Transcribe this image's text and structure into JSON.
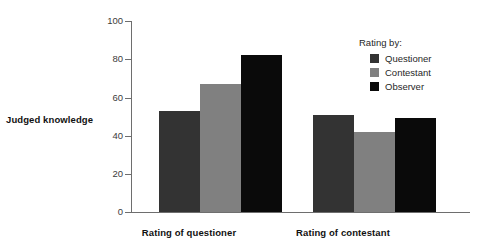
{
  "chart_data": {
    "type": "bar",
    "title": "",
    "subtitle": "",
    "xlabel": "",
    "ylabel": "Judged knowledge",
    "ylim": [
      0,
      100
    ],
    "yticks": [
      0,
      20,
      40,
      60,
      80,
      100
    ],
    "ytick_labels": [
      "0",
      "20",
      "40",
      "60",
      "80",
      "100"
    ],
    "grid": false,
    "legend_position": "top-right",
    "legend_title": "Rating by:",
    "categories": [
      "Rating of questioner",
      "Rating of contestant"
    ],
    "series": [
      {
        "name": "Questioner",
        "color": "#333333",
        "values": [
          53,
          51
        ]
      },
      {
        "name": "Contestant",
        "color": "#808080",
        "values": [
          67,
          42
        ]
      },
      {
        "name": "Observer",
        "color": "#0a0a0a",
        "values": [
          82,
          49
        ]
      }
    ]
  },
  "axis": {
    "y_label": "Judged knowledge",
    "y_ticks": [
      "100",
      "80",
      "60",
      "40",
      "20",
      "0"
    ]
  },
  "legend": {
    "title": "Rating by:",
    "items": [
      {
        "label": "Questioner",
        "swatch": "questioner"
      },
      {
        "label": "Contestant",
        "swatch": "contestant"
      },
      {
        "label": "Observer",
        "swatch": "observer"
      }
    ]
  },
  "groups": [
    {
      "label": "Rating of questioner"
    },
    {
      "label": "Rating of contestant"
    }
  ]
}
